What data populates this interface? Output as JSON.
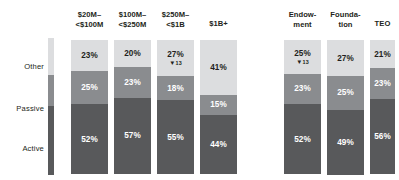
{
  "colors": {
    "other": "#dcdddf",
    "passive": "#8a8c8f",
    "active": "#58595b",
    "text_dark": "#231f20",
    "text_light": "#ffffff",
    "background": "#ffffff"
  },
  "legend": {
    "name": "asset-allocation-legend",
    "items": [
      {
        "label": "Other",
        "key": "other",
        "color": "#dcdddf"
      },
      {
        "label": "Passive",
        "key": "passive",
        "color": "#8a8c8f"
      },
      {
        "label": "Active",
        "key": "active",
        "color": "#58595b"
      }
    ]
  },
  "chart_data": {
    "type": "bar",
    "subtype": "stacked-column-100",
    "title": "",
    "subtitle": "",
    "xlabel": "",
    "ylabel": "",
    "ylim": [
      0,
      100
    ],
    "grid": false,
    "legend_position": "left",
    "value_suffix": "%",
    "categories": [
      "$20M–\n<$100M",
      "$100M–\n<$250M",
      "$250M–\n<$1B",
      "$1B+",
      "Endow-\nment",
      "Founda-\ntion",
      "TEO"
    ],
    "series": [
      {
        "name": "Other",
        "values": [
          23,
          20,
          27,
          41,
          25,
          27,
          21
        ]
      },
      {
        "name": "Passive",
        "values": [
          25,
          23,
          18,
          15,
          23,
          25,
          23
        ]
      },
      {
        "name": "Active",
        "values": [
          52,
          57,
          55,
          44,
          52,
          49,
          56
        ]
      }
    ],
    "annotations": [
      {
        "category": "$250M–<$1B",
        "series": "Other",
        "marker": "▼",
        "value": "13"
      },
      {
        "category": "Endowment",
        "series": "Other",
        "marker": "▼",
        "value": "13"
      }
    ]
  },
  "groups": [
    {
      "name": "by-asset-size",
      "columns": [
        {
          "id": "col-20m-100m",
          "head_line1": "$20M–",
          "head_line2": "<$100M",
          "x": 71,
          "width": 37,
          "segments": [
            {
              "key": "other",
              "label": "23%",
              "pct": 23,
              "text": "dark",
              "delta": null
            },
            {
              "key": "passive",
              "label": "25%",
              "pct": 25,
              "text": "light",
              "delta": null
            },
            {
              "key": "active",
              "label": "52%",
              "pct": 52,
              "text": "light",
              "delta": null
            }
          ]
        },
        {
          "id": "col-100m-250m",
          "head_line1": "$100M–",
          "head_line2": "<$250M",
          "x": 114,
          "width": 37,
          "segments": [
            {
              "key": "other",
              "label": "20%",
              "pct": 20,
              "text": "dark",
              "delta": null
            },
            {
              "key": "passive",
              "label": "23%",
              "pct": 23,
              "text": "light",
              "delta": null
            },
            {
              "key": "active",
              "label": "57%",
              "pct": 57,
              "text": "light",
              "delta": null
            }
          ]
        },
        {
          "id": "col-250m-1b",
          "head_line1": "$250M–",
          "head_line2": "<$1B",
          "x": 157,
          "width": 37,
          "segments": [
            {
              "key": "other",
              "label": "27%",
              "pct": 27,
              "text": "dark",
              "delta": {
                "marker": "▼",
                "value": "13"
              }
            },
            {
              "key": "passive",
              "label": "18%",
              "pct": 18,
              "text": "light",
              "delta": null
            },
            {
              "key": "active",
              "label": "55%",
              "pct": 55,
              "text": "light",
              "delta": null
            }
          ]
        },
        {
          "id": "col-1b-plus",
          "head_line1": "$1B+",
          "head_line2": "",
          "x": 200,
          "width": 37,
          "segments": [
            {
              "key": "other",
              "label": "41%",
              "pct": 41,
              "text": "dark",
              "delta": null
            },
            {
              "key": "passive",
              "label": "15%",
              "pct": 15,
              "text": "light",
              "delta": null
            },
            {
              "key": "active",
              "label": "44%",
              "pct": 44,
              "text": "light",
              "delta": null
            }
          ]
        }
      ]
    },
    {
      "name": "by-organization-type",
      "columns": [
        {
          "id": "col-endowment",
          "head_line1": "Endow-",
          "head_line2": "ment",
          "x": 284,
          "width": 37,
          "segments": [
            {
              "key": "other",
              "label": "25%",
              "pct": 25,
              "text": "dark",
              "delta": {
                "marker": "▼",
                "value": "13"
              }
            },
            {
              "key": "passive",
              "label": "23%",
              "pct": 23,
              "text": "light",
              "delta": null
            },
            {
              "key": "active",
              "label": "52%",
              "pct": 52,
              "text": "light",
              "delta": null
            }
          ]
        },
        {
          "id": "col-foundation",
          "head_line1": "Founda-",
          "head_line2": "tion",
          "x": 327,
          "width": 37,
          "segments": [
            {
              "key": "other",
              "label": "27%",
              "pct": 27,
              "text": "dark",
              "delta": null
            },
            {
              "key": "passive",
              "label": "25%",
              "pct": 25,
              "text": "light",
              "delta": null
            },
            {
              "key": "active",
              "label": "49%",
              "pct": 49,
              "text": "light",
              "delta": null
            }
          ]
        },
        {
          "id": "col-teo",
          "head_line1": "TEO",
          "head_line2": "",
          "x": 370,
          "width": 25,
          "segments": [
            {
              "key": "other",
              "label": "21%",
              "pct": 21,
              "text": "dark",
              "delta": null
            },
            {
              "key": "passive",
              "label": "23%",
              "pct": 23,
              "text": "light",
              "delta": null
            },
            {
              "key": "active",
              "label": "56%",
              "pct": 56,
              "text": "light",
              "delta": null
            }
          ]
        }
      ]
    }
  ]
}
